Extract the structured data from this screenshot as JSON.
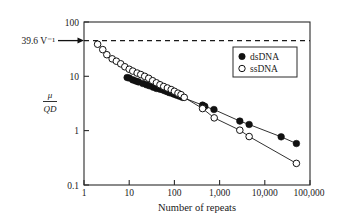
{
  "chart_data": {
    "type": "scatter",
    "title": "",
    "xlabel": "Number of repeats",
    "ylabel_numerator": "μ",
    "ylabel_denominator": "QD",
    "xscale": "log",
    "yscale": "log",
    "xlim": [
      1,
      100000
    ],
    "ylim": [
      0.1,
      100
    ],
    "xticklabels": [
      "1",
      "10",
      "100",
      "1,000",
      "10,000",
      "100,000"
    ],
    "xtickvalues": [
      1,
      10,
      100,
      1000,
      10000,
      100000
    ],
    "yticklabels": [
      "0.1",
      "1",
      "10",
      "100"
    ],
    "ytickvalues": [
      0.1,
      1,
      10,
      100
    ],
    "grid": false,
    "legend_position": "top-right",
    "annotations": [
      {
        "text": "39.6 V⁻¹",
        "value": 39.6,
        "marker": "arrow-right",
        "line": "dashed-horizontal"
      }
    ],
    "series": [
      {
        "name": "dsDNA",
        "marker": "filled-circle",
        "points": [
          [
            9,
            9.5
          ],
          [
            10,
            9.3
          ],
          [
            12,
            8.6
          ],
          [
            14,
            8.2
          ],
          [
            16,
            7.9
          ],
          [
            20,
            7.4
          ],
          [
            24,
            7.0
          ],
          [
            28,
            6.7
          ],
          [
            34,
            6.3
          ],
          [
            40,
            6.0
          ],
          [
            48,
            5.8
          ],
          [
            56,
            5.6
          ],
          [
            62,
            5.4
          ],
          [
            70,
            5.2
          ],
          [
            78,
            5.0
          ],
          [
            88,
            4.9
          ],
          [
            98,
            4.7
          ],
          [
            112,
            4.5
          ],
          [
            130,
            4.3
          ],
          [
            150,
            4.1
          ],
          [
            420,
            2.95
          ],
          [
            470,
            2.8
          ],
          [
            750,
            2.45
          ],
          [
            2800,
            1.5
          ],
          [
            4500,
            1.3
          ],
          [
            23000,
            0.77
          ],
          [
            50000,
            0.58
          ]
        ]
      },
      {
        "name": "ssDNA",
        "marker": "open-circle",
        "points": [
          [
            2,
            39.0
          ],
          [
            2.6,
            31.0
          ],
          [
            3.2,
            25.0
          ],
          [
            4.2,
            21.0
          ],
          [
            5.2,
            19.0
          ],
          [
            6.5,
            17.0
          ],
          [
            8,
            15.0
          ],
          [
            10,
            13.5
          ],
          [
            12,
            12.5
          ],
          [
            15,
            11.5
          ],
          [
            18,
            10.8
          ],
          [
            22,
            10.0
          ],
          [
            27,
            9.2
          ],
          [
            33,
            8.3
          ],
          [
            40,
            7.6
          ],
          [
            48,
            7.0
          ],
          [
            58,
            6.5
          ],
          [
            70,
            6.1
          ],
          [
            85,
            5.7
          ],
          [
            100,
            5.3
          ],
          [
            120,
            4.9
          ],
          [
            140,
            4.6
          ],
          [
            165,
            4.1
          ],
          [
            420,
            2.55
          ],
          [
            760,
            1.72
          ],
          [
            2800,
            1.02
          ],
          [
            4500,
            0.78
          ],
          [
            50000,
            0.25
          ]
        ]
      }
    ]
  },
  "legend": {
    "items": [
      {
        "label": "dsDNA",
        "marker": "filled-circle"
      },
      {
        "label": "ssDNA",
        "marker": "open-circle"
      }
    ]
  },
  "colors": {
    "ink": "#111111",
    "axis": "#2b2b2b",
    "background": "#ffffff"
  }
}
